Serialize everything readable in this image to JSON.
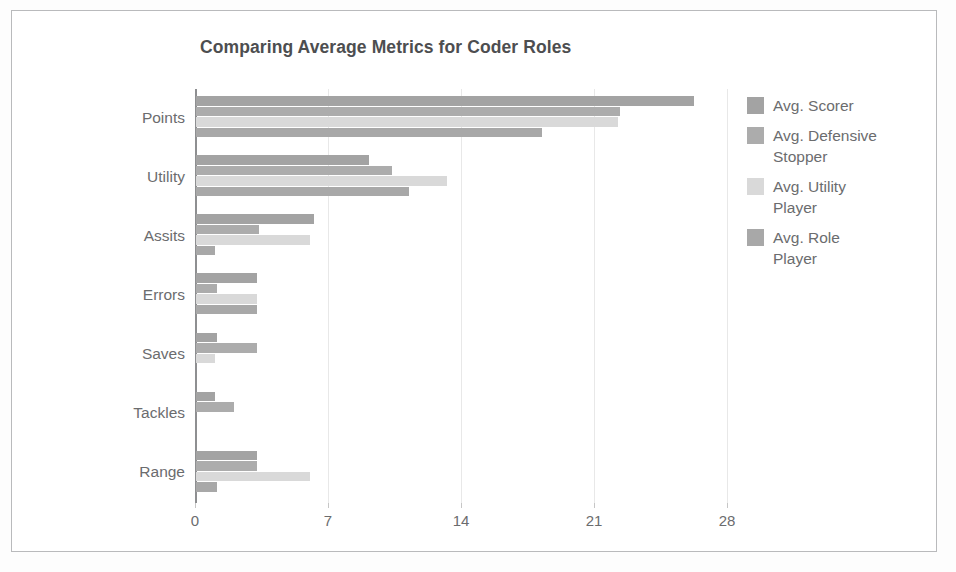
{
  "chart_data": {
    "type": "bar",
    "orientation": "horizontal",
    "title": "Comparing Average Metrics for Coder Roles",
    "xlabel": "",
    "ylabel": "",
    "categories": [
      "Points",
      "Utility",
      "Assits",
      "Errors",
      "Saves",
      "Tackles",
      "Range"
    ],
    "xticks": [
      0,
      7,
      14,
      21,
      28
    ],
    "xlim": [
      0,
      28
    ],
    "grid": true,
    "legend_position": "right",
    "series": [
      {
        "name": "Avg. Scorer",
        "color": "#a3a3a3",
        "values": [
          26.2,
          9.1,
          6.2,
          3.2,
          1.1,
          1.0,
          3.2
        ]
      },
      {
        "name": "Avg. Defensive Stopper",
        "color": "#acacac",
        "values": [
          22.3,
          10.3,
          3.3,
          1.1,
          3.2,
          2.0,
          3.2
        ]
      },
      {
        "name": "Avg. Utility Player",
        "color": "#d9d9d9",
        "values": [
          22.2,
          13.2,
          6.0,
          3.2,
          1.0,
          0.0,
          6.0
        ]
      },
      {
        "name": "Avg. Role Player",
        "color": "#a8a8a8",
        "values": [
          18.2,
          11.2,
          1.0,
          3.2,
          0.0,
          0.0,
          1.1
        ]
      }
    ]
  }
}
